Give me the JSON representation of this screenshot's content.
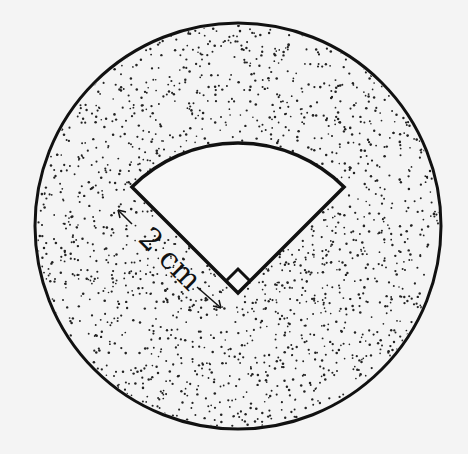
{
  "figure": {
    "sector_angle_deg": 90,
    "right_angle_marker": true,
    "radius_label": "2 cm",
    "shaded_region": "circle minus sector",
    "colors": {
      "stroke": "#111111",
      "background": "#f4f4f4",
      "dots": "#222222"
    }
  }
}
